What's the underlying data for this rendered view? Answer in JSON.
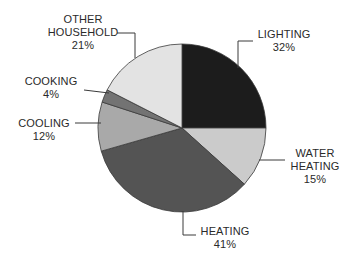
{
  "chart_data": {
    "type": "pie",
    "title": "",
    "xlabel": "",
    "ylabel": "",
    "legend": "none (direct labels with leader lines)",
    "grid": false,
    "categories": [
      "Lighting",
      "Water Heating",
      "Heating",
      "Cooling",
      "Cooking",
      "Other Household"
    ],
    "values": [
      32,
      15,
      41,
      12,
      4,
      21
    ],
    "unit": "%",
    "slices": [
      {
        "name": "lighting",
        "lines": [
          "LIGHTING"
        ],
        "pct": "32%",
        "value": 32,
        "color": "#1c1c1c",
        "start_deg": 0,
        "end_deg": 90
      },
      {
        "name": "water-heating",
        "lines": [
          "WATER",
          "HEATING"
        ],
        "pct": "15%",
        "value": 15,
        "color": "#cbcbcb",
        "start_deg": 90,
        "end_deg": 132
      },
      {
        "name": "heating",
        "lines": [
          "HEATING"
        ],
        "pct": "41%",
        "value": 41,
        "color": "#545454",
        "start_deg": 132,
        "end_deg": 254
      },
      {
        "name": "cooling",
        "lines": [
          "COOLING"
        ],
        "pct": "12%",
        "value": 12,
        "color": "#a9a9a9",
        "start_deg": 254,
        "end_deg": 288
      },
      {
        "name": "cooking",
        "lines": [
          "COOKING"
        ],
        "pct": "4%",
        "value": 4,
        "color": "#737373",
        "start_deg": 288,
        "end_deg": 297
      },
      {
        "name": "other-household",
        "lines": [
          "OTHER",
          "HOUSEHOLD"
        ],
        "pct": "21%",
        "value": 21,
        "color": "#e3e3e3",
        "start_deg": 297,
        "end_deg": 360
      }
    ]
  },
  "labels": {
    "lighting": {
      "line1": "LIGHTING",
      "line2": "32%"
    },
    "water_heating": {
      "line1": "WATER",
      "line2": "HEATING",
      "line3": "15%"
    },
    "heating": {
      "line1": "HEATING",
      "line2": "41%"
    },
    "cooling": {
      "line1": "COOLING",
      "line2": "12%"
    },
    "cooking": {
      "line1": "COOKING",
      "line2": "4%"
    },
    "other_household": {
      "line1": "OTHER",
      "line2": "HOUSEHOLD",
      "line3": "21%"
    }
  },
  "geometry": {
    "cx": 182,
    "cy": 128,
    "r": 84,
    "stroke": "#3a3a3a",
    "leader_color": "#3a3a3a"
  }
}
